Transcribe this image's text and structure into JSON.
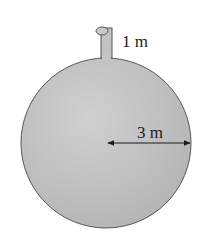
{
  "diagram": {
    "type": "spherical-tank",
    "tank": {
      "shape": "sphere",
      "fill_color": "#c2c2c2",
      "outline_color": "#555555"
    },
    "spout": {
      "height_label": "1 m"
    },
    "radius": {
      "label": "3 m"
    }
  }
}
